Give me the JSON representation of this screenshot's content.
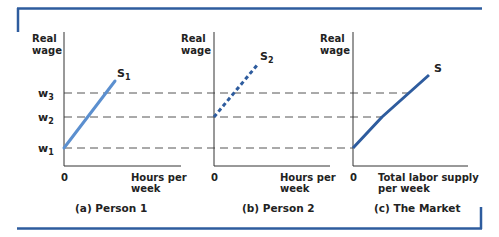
{
  "colors": {
    "frame": "#2e5c9e",
    "curve_person1": "#5b8fcf",
    "curve_person2": "#2e5c9e",
    "curve_market": "#2e5c9e"
  },
  "wage_levels": {
    "w1": {
      "label_main": "w",
      "label_sub": "1"
    },
    "w2": {
      "label_main": "w",
      "label_sub": "2"
    },
    "w3": {
      "label_main": "w",
      "label_sub": "3"
    }
  },
  "panels": [
    {
      "id": "person1",
      "y_label_line1": "Real",
      "y_label_line2": "wage",
      "origin_label": "0",
      "x_label_line1": "Hours per",
      "x_label_line2": "week",
      "caption": "(a) Person 1",
      "curve_label_main": "S",
      "curve_label_sub": "1",
      "curve_style": "solid"
    },
    {
      "id": "person2",
      "y_label_line1": "Real",
      "y_label_line2": "wage",
      "origin_label": "0",
      "x_label_line1": "Hours per",
      "x_label_line2": "week",
      "caption": "(b) Person 2",
      "curve_label_main": "S",
      "curve_label_sub": "2",
      "curve_style": "dotted"
    },
    {
      "id": "market",
      "y_label_line1": "Real",
      "y_label_line2": "wage",
      "origin_label": "0",
      "x_label_line1": "Total labor supply",
      "x_label_line2": "per week",
      "caption": "(c) The Market",
      "curve_label_main": "S",
      "curve_label_sub": "",
      "curve_style": "solid"
    }
  ]
}
